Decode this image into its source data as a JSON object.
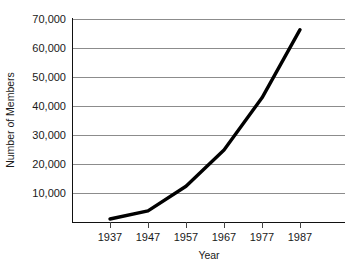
{
  "chart_data": {
    "type": "line",
    "title": "",
    "xlabel": "Year",
    "ylabel": "Number of Members",
    "categories": [
      "1937",
      "1947",
      "1957",
      "1967",
      "1977",
      "1987"
    ],
    "x": [
      1937,
      1947,
      1957,
      1967,
      1977,
      1987
    ],
    "values": [
      1200,
      4000,
      12500,
      25000,
      43000,
      66500
    ],
    "series": [
      {
        "name": "Number of Members",
        "values": [
          1200,
          4000,
          12500,
          25000,
          43000,
          66500
        ]
      }
    ],
    "xlim": [
      1932,
      1992
    ],
    "ylim": [
      0,
      70000
    ],
    "ytick_labels": [
      "70,000",
      "60,000",
      "50,000",
      "40,000",
      "30,000",
      "20,000",
      "10,000"
    ],
    "ytick_values": [
      70000,
      60000,
      50000,
      40000,
      30000,
      20000,
      10000
    ],
    "xtick_labels": [
      "1937",
      "1947",
      "1957",
      "1967",
      "1977",
      "1987"
    ],
    "grid": "horizontal",
    "legend": "none",
    "line_color": "#000000",
    "grid_color": "#8c8c8c",
    "axis_color": "#111111",
    "background": "#ffffff"
  }
}
